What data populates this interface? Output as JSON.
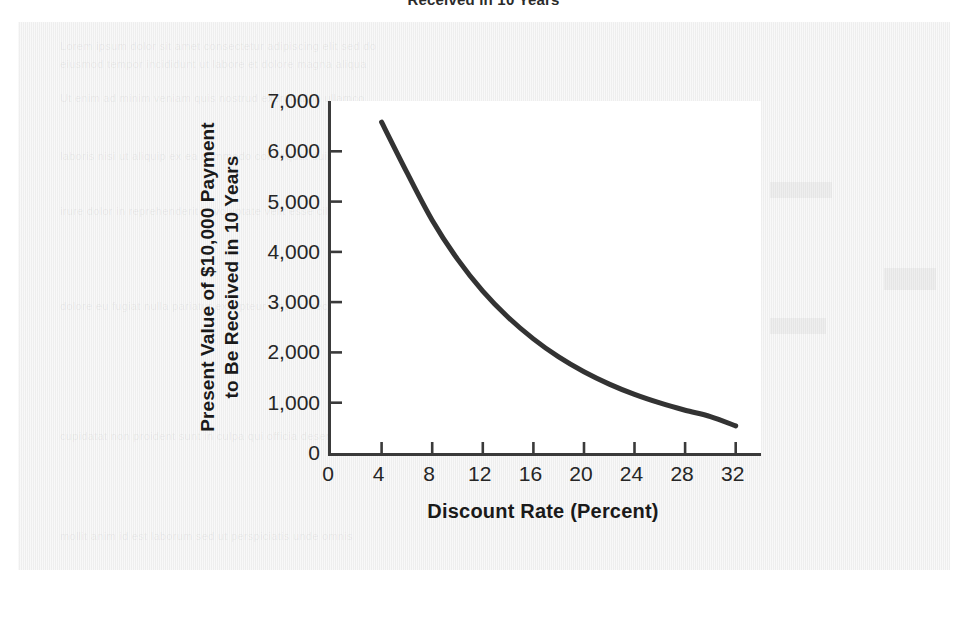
{
  "page": {
    "caption_top": "Received in 10 Years",
    "ghost_texts": [
      "Lorem ipsum dolor sit amet consectetur adipiscing elit sed do",
      "eiusmod tempor incididunt ut labore et dolore magna aliqua",
      "Ut enim ad minim veniam quis nostrud exercitation ullamco",
      "laboris nisi ut aliquip ex ea commodo consequat duis aute",
      "irure dolor in reprehenderit in voluptate velit esse cillum",
      "dolore eu fugiat nulla pariatur excepteur sint occaecat",
      "cupidatat non proident sunt in culpa qui officia deserunt",
      "mollit anim id est laborum sed ut perspiciatis unde omnis"
    ]
  },
  "chart_data": {
    "type": "line",
    "title": "",
    "xlabel": "Discount Rate (Percent)",
    "ylabel_lines": [
      "Present Value of $10,000 Payment",
      "to Be Received in 10 Years"
    ],
    "ylabel": "Present Value of $10,000 Payment to Be Received in 10 Years",
    "xlim": [
      0,
      34
    ],
    "ylim": [
      0,
      7000
    ],
    "xticks": [
      0,
      4,
      8,
      12,
      16,
      20,
      24,
      28,
      32
    ],
    "xtick_labels": [
      "0",
      "4",
      "8",
      "12",
      "16",
      "20",
      "24",
      "28",
      "32"
    ],
    "yticks": [
      0,
      1000,
      2000,
      3000,
      4000,
      5000,
      6000,
      7000
    ],
    "ytick_labels": [
      "0",
      "1,000",
      "2,000",
      "3,000",
      "4,000",
      "5,000",
      "6,000",
      "7,000"
    ],
    "grid": false,
    "legend": false,
    "line_color": "#333333",
    "line_width": 5,
    "series": [
      {
        "name": "Present Value of $10,000 in 10 Years",
        "x": [
          4,
          6,
          8,
          10,
          12,
          14,
          16,
          18,
          20,
          22,
          24,
          26,
          28,
          30,
          32
        ],
        "y": [
          6580,
          5580,
          4630,
          3855,
          3220,
          2700,
          2270,
          1910,
          1615,
          1370,
          1165,
          995,
          850,
          725,
          540
        ]
      }
    ]
  }
}
